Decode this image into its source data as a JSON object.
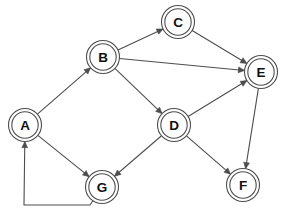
{
  "diagram": {
    "type": "directed-graph",
    "width": 282,
    "height": 214,
    "background_color": "#ffffff",
    "stroke_color": "#4d4d4d",
    "label_color": "#111111",
    "node_style": "double-circle",
    "node_outer_radius": 16.5,
    "node_inner_radius": 13.2,
    "nodes": [
      {
        "id": "A",
        "label": "A",
        "x": 25,
        "y": 125
      },
      {
        "id": "B",
        "label": "B",
        "x": 103,
        "y": 57
      },
      {
        "id": "C",
        "label": "C",
        "x": 178,
        "y": 22
      },
      {
        "id": "D",
        "label": "D",
        "x": 174,
        "y": 125
      },
      {
        "id": "E",
        "label": "E",
        "x": 261,
        "y": 72
      },
      {
        "id": "F",
        "label": "F",
        "x": 243,
        "y": 185
      },
      {
        "id": "G",
        "label": "G",
        "x": 102,
        "y": 187
      }
    ],
    "edges": [
      {
        "id": "A-B",
        "from": "A",
        "to": "B",
        "directed": true,
        "shape": "straight"
      },
      {
        "id": "A-G",
        "from": "A",
        "to": "G",
        "directed": true,
        "shape": "straight"
      },
      {
        "id": "B-C",
        "from": "B",
        "to": "C",
        "directed": true,
        "shape": "straight"
      },
      {
        "id": "B-E",
        "from": "B",
        "to": "E",
        "directed": true,
        "shape": "straight"
      },
      {
        "id": "B-D",
        "from": "B",
        "to": "D",
        "directed": true,
        "shape": "straight"
      },
      {
        "id": "C-E",
        "from": "C",
        "to": "E",
        "directed": true,
        "shape": "straight"
      },
      {
        "id": "D-E",
        "from": "D",
        "to": "E",
        "directed": true,
        "shape": "straight"
      },
      {
        "id": "D-G",
        "from": "D",
        "to": "G",
        "directed": true,
        "shape": "straight"
      },
      {
        "id": "D-F",
        "from": "D",
        "to": "F",
        "directed": true,
        "shape": "straight"
      },
      {
        "id": "E-F",
        "from": "E",
        "to": "F",
        "directed": true,
        "shape": "straight"
      },
      {
        "id": "G-A",
        "from": "G",
        "to": "A",
        "directed": true,
        "shape": "orthogonal",
        "waypoints": [
          [
            90,
            205
          ],
          [
            24,
            205
          ]
        ]
      }
    ]
  }
}
